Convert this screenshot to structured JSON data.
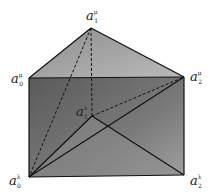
{
  "diagram": {
    "type": "triangular-prism",
    "colors": {
      "top_face": "#a8a8a8",
      "front_face": "#6e6e6e",
      "right_face_light": "#9a9a9a",
      "edge": "#111111"
    },
    "vertices": [
      {
        "id": "a1_mu",
        "base": "a",
        "sub": "1",
        "sup": "μ",
        "x": 91,
        "y": 28
      },
      {
        "id": "a0_mu",
        "base": "a",
        "sub": "0",
        "sup": "μ",
        "x": 29,
        "y": 78
      },
      {
        "id": "a2_mu",
        "base": "a",
        "sub": "2",
        "sup": "μ",
        "x": 184,
        "y": 77
      },
      {
        "id": "a1_lambda",
        "base": "a",
        "sub": "1",
        "sup": "λ",
        "x": 92,
        "y": 116
      },
      {
        "id": "a0_lambda",
        "base": "a",
        "sub": "0",
        "sup": "λ",
        "x": 29,
        "y": 177
      },
      {
        "id": "a2_lambda",
        "base": "a",
        "sub": "2",
        "sup": "λ",
        "x": 184,
        "y": 175
      }
    ],
    "labels": {
      "a1_mu": {
        "base": "a",
        "sub": "1",
        "sup": "μ"
      },
      "a0_mu": {
        "base": "a",
        "sub": "0",
        "sup": "μ"
      },
      "a2_mu": {
        "base": "a",
        "sub": "2",
        "sup": "μ"
      },
      "a1_lambda": {
        "base": "a",
        "sub": "1",
        "sup": "λ"
      },
      "a0_lambda": {
        "base": "a",
        "sub": "0",
        "sup": "λ"
      },
      "a2_lambda": {
        "base": "a",
        "sub": "2",
        "sup": "λ"
      }
    }
  }
}
